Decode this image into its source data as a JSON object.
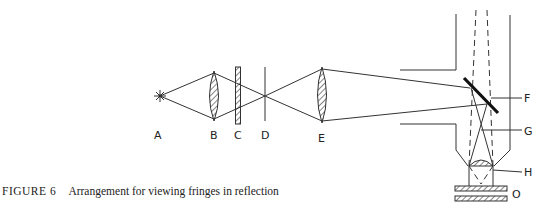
{
  "figure": {
    "number_label": "FIGURE 6",
    "caption": "Arrangement for viewing fringes in reflection"
  },
  "components": [
    {
      "id": "A",
      "label": "A",
      "description": "point light source"
    },
    {
      "id": "B",
      "label": "B",
      "description": "condenser lens"
    },
    {
      "id": "C",
      "label": "C",
      "description": "filter plate"
    },
    {
      "id": "D",
      "label": "D",
      "description": "aperture stop"
    },
    {
      "id": "E",
      "label": "E",
      "description": "collimating lens"
    },
    {
      "id": "F",
      "label": "F",
      "description": "inclined beam-splitter mirror"
    },
    {
      "id": "G",
      "label": "G",
      "description": "ray crossover point"
    },
    {
      "id": "H",
      "label": "H",
      "description": "objective lens"
    },
    {
      "id": "O",
      "label": "O",
      "description": "object plates"
    }
  ],
  "colors": {
    "line": "#333333",
    "background": "#ffffff"
  }
}
